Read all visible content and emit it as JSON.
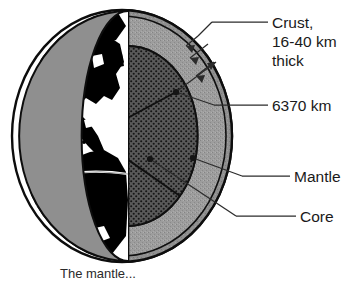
{
  "figure": {
    "caption": "The mantle...",
    "labels": [
      {
        "name": "crust-label",
        "lines": [
          "Crust,",
          "16-40 km",
          "thick"
        ],
        "x": 272,
        "y": 22
      },
      {
        "name": "radius-label",
        "lines": [
          "6370 km"
        ],
        "x": 272,
        "y": 110
      },
      {
        "name": "mantle-label",
        "lines": [
          "Mantle"
        ],
        "x": 294,
        "y": 180
      },
      {
        "name": "core-label",
        "lines": [
          "Core"
        ],
        "x": 300,
        "y": 221
      }
    ],
    "colors": {
      "ink": "#111111",
      "mantle_fill": "#9a9a9a",
      "core_fill": "#4e4e4e",
      "crust_band": "#8d8d8d",
      "land_fill": "#000000",
      "ocean_fill": "#ffffff",
      "leader_line": "#2b2b2b"
    },
    "geometry": {
      "sphere_center_x": 122,
      "sphere_center_y": 136,
      "sphere_radius_x": 110,
      "sphere_radius_y": 126,
      "cut_line_x": 128,
      "crust_thickness_px": 7,
      "mantle_outer_radius_x": 104,
      "core_radius_x": 64
    },
    "annotations": {
      "crust_arrows": 3,
      "leader_dots": 3
    }
  }
}
